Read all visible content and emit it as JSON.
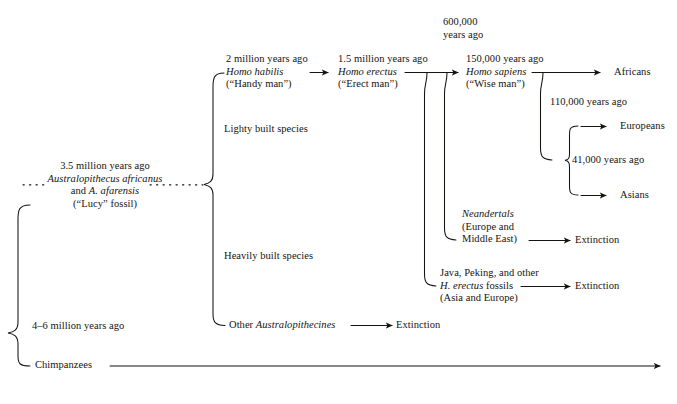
{
  "diagram": {
    "line_color": "#17130f",
    "text_color": "#17130f",
    "background": "#ffffff",
    "nodes": {
      "root_age": "4–6 million years ago",
      "chimpanzees": "Chimpanzees",
      "austro_age": "3.5 million years ago",
      "austro_species": "Australopithecus africanus",
      "austro_and": "and A. afarensis",
      "austro_and_prefix": "and ",
      "austro_and_italic": "A. afarensis",
      "austro_fossil": "(“Lucy” fossil)",
      "lightly_built": "Lighty built species",
      "heavily_built": "Heavily built species",
      "other_austro_prefix": "Other ",
      "other_austro_italic": "Australopithecines",
      "other_austro_extinction": "Extinction",
      "habilis_age": "2 million years ago",
      "habilis_name": "Homo habilis",
      "habilis_nick": "(“Handy man”)",
      "erectus_age": "1.5 million years ago",
      "erectus_name": "Homo erectus",
      "erectus_nick": "(“Erect man”)",
      "six_hundred_thousand_line1": "600,000",
      "six_hundred_thousand_line2": "years ago",
      "sapiens_age": "150,000 years ago",
      "sapiens_name": "Homo sapiens",
      "sapiens_nick": "(“Wise man”)",
      "africans": "Africans",
      "one_ten_thousand": "110,000 years ago",
      "europeans": "Europeans",
      "forty_one_thousand": "41,000 years ago",
      "asians": "Asians",
      "neandertals_name": "Neandertals",
      "neandertals_region1": "(Europe and",
      "neandertals_region2": "Middle East)",
      "neandertals_extinction": "Extinction",
      "java_line1": "Java, Peking, and other",
      "java_line2_italic": "H. erectus",
      "java_line2_rest": " fossils",
      "java_line3": "(Asia and Europe)",
      "java_extinction": "Extinction"
    }
  }
}
